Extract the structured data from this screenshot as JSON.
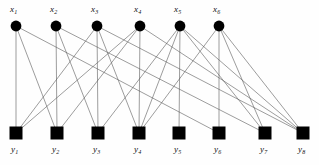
{
  "figure": {
    "type": "bipartite-graph",
    "background_color": "#fefefe",
    "node_color": "#000000",
    "edge_color": "#5a5a5a",
    "edge_width": 0.6
  },
  "top_nodes": [
    {
      "id": "x1",
      "label": "x",
      "sub": "1",
      "shape": "circle",
      "cx": 16,
      "cy": 26,
      "r": 5.4,
      "label_x": 10,
      "label_y": 5
    },
    {
      "id": "x2",
      "label": "x",
      "sub": "2",
      "shape": "circle",
      "cx": 56,
      "cy": 26,
      "r": 5.4,
      "label_x": 50,
      "label_y": 5
    },
    {
      "id": "x3",
      "label": "x",
      "sub": "3",
      "shape": "circle",
      "cx": 97,
      "cy": 26,
      "r": 5.4,
      "label_x": 91,
      "label_y": 5
    },
    {
      "id": "x4",
      "label": "x",
      "sub": "4",
      "shape": "circle",
      "cx": 140,
      "cy": 26,
      "r": 5.4,
      "label_x": 134,
      "label_y": 5
    },
    {
      "id": "x5",
      "label": "x",
      "sub": "5",
      "shape": "circle",
      "cx": 180,
      "cy": 26,
      "r": 5.4,
      "label_x": 174,
      "label_y": 5
    },
    {
      "id": "x6",
      "label": "x",
      "sub": "6",
      "shape": "circle",
      "cx": 219,
      "cy": 26,
      "r": 5.4,
      "label_x": 213,
      "label_y": 5
    }
  ],
  "bottom_nodes": [
    {
      "id": "y1",
      "label": "y",
      "sub": "1",
      "shape": "square",
      "cx": 16,
      "cy": 133,
      "size": 13,
      "label_x": 11,
      "label_y": 145
    },
    {
      "id": "y2",
      "label": "y",
      "sub": "2",
      "shape": "square",
      "cx": 57,
      "cy": 133,
      "size": 13,
      "label_x": 52,
      "label_y": 145
    },
    {
      "id": "y3",
      "label": "y",
      "sub": "3",
      "shape": "square",
      "cx": 98,
      "cy": 133,
      "size": 13,
      "label_x": 93,
      "label_y": 145
    },
    {
      "id": "y4",
      "label": "y",
      "sub": "4",
      "shape": "square",
      "cx": 139,
      "cy": 133,
      "size": 13,
      "label_x": 134,
      "label_y": 145
    },
    {
      "id": "y5",
      "label": "y",
      "sub": "5",
      "shape": "square",
      "cx": 179,
      "cy": 133,
      "size": 13,
      "label_x": 174,
      "label_y": 145
    },
    {
      "id": "y6",
      "label": "y",
      "sub": "6",
      "shape": "square",
      "cx": 219,
      "cy": 133,
      "size": 13,
      "label_x": 214,
      "label_y": 145
    },
    {
      "id": "y7",
      "label": "y",
      "sub": "7",
      "shape": "square",
      "cx": 265,
      "cy": 133,
      "size": 13,
      "label_x": 260,
      "label_y": 145
    },
    {
      "id": "y8",
      "label": "y",
      "sub": "8",
      "shape": "square",
      "cx": 303,
      "cy": 133,
      "size": 13,
      "label_x": 298,
      "label_y": 145
    }
  ],
  "edges": [
    {
      "from": "x1",
      "to": "y1"
    },
    {
      "from": "x1",
      "to": "y2"
    },
    {
      "from": "x1",
      "to": "y6"
    },
    {
      "from": "x2",
      "to": "y2"
    },
    {
      "from": "x2",
      "to": "y3"
    },
    {
      "from": "x2",
      "to": "y7"
    },
    {
      "from": "x3",
      "to": "y1"
    },
    {
      "from": "x3",
      "to": "y3"
    },
    {
      "from": "x3",
      "to": "y4"
    },
    {
      "from": "x3",
      "to": "y8"
    },
    {
      "from": "x4",
      "to": "y1"
    },
    {
      "from": "x4",
      "to": "y2"
    },
    {
      "from": "x4",
      "to": "y4"
    },
    {
      "from": "x4",
      "to": "y8"
    },
    {
      "from": "x5",
      "to": "y3"
    },
    {
      "from": "x5",
      "to": "y4"
    },
    {
      "from": "x5",
      "to": "y5"
    },
    {
      "from": "x5",
      "to": "y7"
    },
    {
      "from": "x5",
      "to": "y8"
    },
    {
      "from": "x6",
      "to": "y4"
    },
    {
      "from": "x6",
      "to": "y6"
    },
    {
      "from": "x6",
      "to": "y7"
    },
    {
      "from": "x6",
      "to": "y8"
    }
  ]
}
